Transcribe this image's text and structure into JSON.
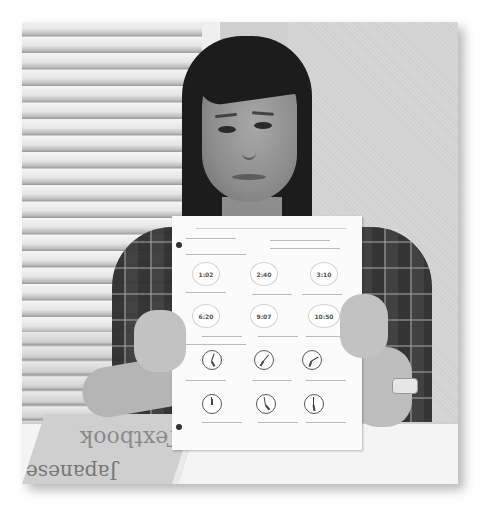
{
  "image": {
    "description": "Grayscale photo of a woman holding up a Japanese time-telling worksheet in front of window blinds, with a textbook on the table",
    "style": "grayscale photograph with drop shadow"
  },
  "worksheet": {
    "row1_times": [
      "1:02",
      "2:40",
      "3:10"
    ],
    "row2_times": [
      "6:20",
      "9:07",
      "10:50"
    ],
    "clock_rows": 2,
    "clocks_per_row": 3
  },
  "textbook": {
    "title_text": "Textbook",
    "subtitle_text": "Japanese"
  }
}
